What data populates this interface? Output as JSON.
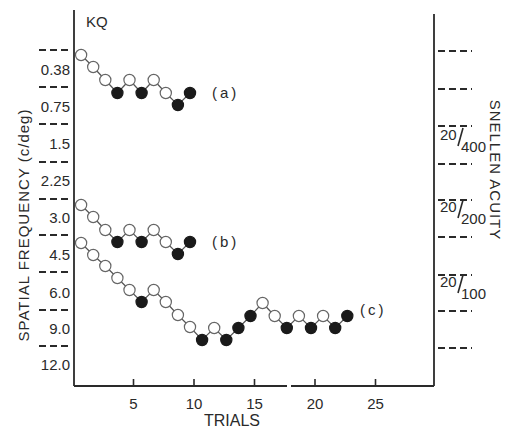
{
  "chart_data": {
    "type": "line",
    "title": "KQ",
    "xlabel": "TRIALS",
    "ylabel": "SPATIAL FREQUENCY (c/deg)",
    "ylabel_right": "SNELLEN ACUITY",
    "x_ticks": [
      5,
      10,
      15,
      20,
      25
    ],
    "xlim": [
      0,
      30
    ],
    "y_tick_labels_left": [
      "0.38",
      "0.75",
      "1.5",
      "2.25",
      "3.0",
      "4.5",
      "6.0",
      "9.0",
      "12.0"
    ],
    "y_tick_labels_right": [
      {
        "label": "20/400",
        "between": [
          "1.5",
          "2.25"
        ]
      },
      {
        "label": "20/200",
        "between": [
          "3.0",
          "4.5"
        ]
      },
      {
        "label": "20/100",
        "between": [
          "6.0",
          "9.0"
        ]
      }
    ],
    "y_axis_inverted": true,
    "legend": [],
    "marker_legend": {
      "open": "correct response (step to higher frequency)",
      "filled": "error (step to lower frequency)"
    },
    "series": [
      {
        "name": "(a)",
        "label": "(a)",
        "points": [
          {
            "trial": 1,
            "y_px": 55,
            "filled": false
          },
          {
            "trial": 2,
            "y_px": 67,
            "filled": false
          },
          {
            "trial": 3,
            "y_px": 80,
            "filled": false
          },
          {
            "trial": 4,
            "y_px": 93,
            "filled": true
          },
          {
            "trial": 5,
            "y_px": 80,
            "filled": false
          },
          {
            "trial": 6,
            "y_px": 93,
            "filled": true
          },
          {
            "trial": 7,
            "y_px": 80,
            "filled": false
          },
          {
            "trial": 8,
            "y_px": 93,
            "filled": false
          },
          {
            "trial": 9,
            "y_px": 105,
            "filled": true
          },
          {
            "trial": 10,
            "y_px": 93,
            "filled": true
          }
        ]
      },
      {
        "name": "(b)",
        "label": "(b)",
        "points": [
          {
            "trial": 1,
            "y_px": 205,
            "filled": false
          },
          {
            "trial": 2,
            "y_px": 217,
            "filled": false
          },
          {
            "trial": 3,
            "y_px": 230,
            "filled": false
          },
          {
            "trial": 4,
            "y_px": 242,
            "filled": true
          },
          {
            "trial": 5,
            "y_px": 230,
            "filled": false
          },
          {
            "trial": 6,
            "y_px": 242,
            "filled": true
          },
          {
            "trial": 7,
            "y_px": 230,
            "filled": false
          },
          {
            "trial": 8,
            "y_px": 242,
            "filled": false
          },
          {
            "trial": 9,
            "y_px": 254,
            "filled": true
          },
          {
            "trial": 10,
            "y_px": 242,
            "filled": true
          }
        ]
      },
      {
        "name": "(c)",
        "label": "(c)",
        "points": [
          {
            "trial": 1,
            "y_px": 243,
            "filled": false
          },
          {
            "trial": 2,
            "y_px": 255,
            "filled": false
          },
          {
            "trial": 3,
            "y_px": 266,
            "filled": false
          },
          {
            "trial": 4,
            "y_px": 278,
            "filled": false
          },
          {
            "trial": 5,
            "y_px": 290,
            "filled": false
          },
          {
            "trial": 6,
            "y_px": 302,
            "filled": true
          },
          {
            "trial": 7,
            "y_px": 290,
            "filled": false
          },
          {
            "trial": 8,
            "y_px": 302,
            "filled": false
          },
          {
            "trial": 9,
            "y_px": 315,
            "filled": false
          },
          {
            "trial": 10,
            "y_px": 327,
            "filled": false
          },
          {
            "trial": 11,
            "y_px": 340,
            "filled": true
          },
          {
            "trial": 12,
            "y_px": 328,
            "filled": false
          },
          {
            "trial": 13,
            "y_px": 340,
            "filled": true
          },
          {
            "trial": 14,
            "y_px": 328,
            "filled": true
          },
          {
            "trial": 15,
            "y_px": 316,
            "filled": true
          },
          {
            "trial": 16,
            "y_px": 303,
            "filled": false
          },
          {
            "trial": 17,
            "y_px": 316,
            "filled": false
          },
          {
            "trial": 18,
            "y_px": 328,
            "filled": true
          },
          {
            "trial": 19,
            "y_px": 316,
            "filled": false
          },
          {
            "trial": 20,
            "y_px": 328,
            "filled": true
          },
          {
            "trial": 21,
            "y_px": 316,
            "filled": false
          },
          {
            "trial": 22,
            "y_px": 328,
            "filled": true
          },
          {
            "trial": 23,
            "y_px": 316,
            "filled": true
          }
        ]
      }
    ],
    "grid": false
  },
  "layout": {
    "left_axis_x": 74,
    "right_axis_x": 434,
    "axis_top": 10,
    "right_axis_top": 14,
    "axis_bottom": 386,
    "x0_px": 73,
    "px_per_trial": 12.1,
    "left_dashes_y": [
      50,
      87,
      124,
      162,
      199,
      235,
      272,
      310,
      346
    ],
    "left_label_y": [
      69,
      106,
      143,
      180,
      217,
      254,
      292,
      328,
      364
    ],
    "right_dashes_y": [
      51,
      89,
      126,
      164,
      200,
      237,
      275,
      311,
      348
    ],
    "right_label_y": [
      140,
      212,
      287
    ],
    "series_label_pos": [
      [
        212,
        93
      ],
      [
        212,
        242
      ],
      [
        360,
        310
      ]
    ],
    "x_axis_break": [
      287,
      291
    ]
  }
}
